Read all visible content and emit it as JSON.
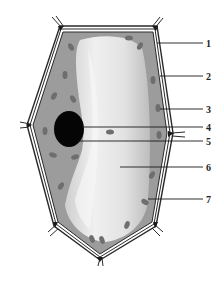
{
  "diagram": {
    "type": "plant-cell-labeled",
    "colors": {
      "wall": "#2a2a2a",
      "cytoplasm": "#9a9a9a",
      "vacuole": "#d9d9d9",
      "vacuole_highlight": "#efefef",
      "chloroplast": "#6e6e6e",
      "nucleus": "#050505",
      "leader_line": "#1a1a1a"
    },
    "labels": [
      {
        "number": "1",
        "y": 43
      },
      {
        "number": "2",
        "y": 76
      },
      {
        "number": "3",
        "y": 109
      },
      {
        "number": "4",
        "y": 127
      },
      {
        "number": "5",
        "y": 141
      },
      {
        "number": "6",
        "y": 167
      },
      {
        "number": "7",
        "y": 199
      }
    ]
  }
}
